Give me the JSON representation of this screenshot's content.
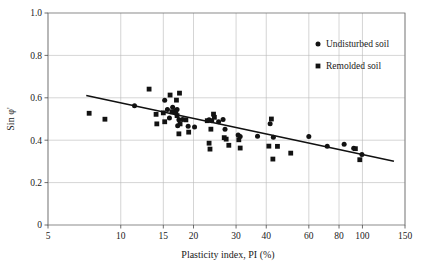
{
  "chart_data": {
    "type": "scatter",
    "title": "",
    "xlabel": "Plasticity index, PI (%)",
    "ylabel": "Sin φ'",
    "xscale": "log",
    "yscale": "linear",
    "xlim": [
      5,
      150
    ],
    "ylim": [
      0,
      1.0
    ],
    "grid": true,
    "xticks": [
      5,
      10,
      15,
      20,
      30,
      40,
      60,
      80,
      100,
      150
    ],
    "xtick_labels": [
      "5",
      "10",
      "15",
      "20",
      "30",
      "40",
      "60",
      "80",
      "100",
      "150"
    ],
    "yticks": [
      0,
      0.2,
      0.4,
      0.6,
      0.8,
      1.0
    ],
    "ytick_labels": [
      "0",
      "0.2",
      "0.4",
      "0.6",
      "0.8",
      "1.0"
    ],
    "legend_position": "top-right",
    "series": [
      {
        "name": "Undisturbed soil",
        "marker": "circle",
        "color": "#121212",
        "points": [
          [
            11.4,
            0.562
          ],
          [
            15.2,
            0.588
          ],
          [
            15.6,
            0.545
          ],
          [
            16.4,
            0.555
          ],
          [
            16.7,
            0.535
          ],
          [
            16.9,
            0.528
          ],
          [
            17.1,
            0.545
          ],
          [
            15.9,
            0.505
          ],
          [
            17.4,
            0.497
          ],
          [
            17.2,
            0.468
          ],
          [
            18.0,
            0.498
          ],
          [
            19.0,
            0.466
          ],
          [
            20.2,
            0.462
          ],
          [
            23.2,
            0.497
          ],
          [
            23.8,
            0.492
          ],
          [
            25.4,
            0.487
          ],
          [
            26.5,
            0.498
          ],
          [
            27.0,
            0.452
          ],
          [
            30.6,
            0.425
          ],
          [
            31.2,
            0.418
          ],
          [
            36.8,
            0.419
          ],
          [
            41.5,
            0.478
          ],
          [
            42.8,
            0.414
          ],
          [
            60.0,
            0.418
          ],
          [
            71.5,
            0.372
          ],
          [
            84.0,
            0.381
          ],
          [
            92.0,
            0.362
          ],
          [
            99.5,
            0.332
          ]
        ]
      },
      {
        "name": "Remolded soil",
        "marker": "square",
        "color": "#121212",
        "points": [
          [
            7.4,
            0.527
          ],
          [
            8.6,
            0.499
          ],
          [
            13.1,
            0.641
          ],
          [
            14.0,
            0.522
          ],
          [
            14.1,
            0.477
          ],
          [
            15.0,
            0.529
          ],
          [
            15.2,
            0.487
          ],
          [
            16.0,
            0.613
          ],
          [
            16.3,
            0.534
          ],
          [
            17.0,
            0.589
          ],
          [
            17.5,
            0.622
          ],
          [
            17.1,
            0.516
          ],
          [
            17.6,
            0.477
          ],
          [
            17.4,
            0.43
          ],
          [
            18.6,
            0.496
          ],
          [
            19.1,
            0.438
          ],
          [
            22.8,
            0.492
          ],
          [
            23.6,
            0.452
          ],
          [
            24.2,
            0.523
          ],
          [
            24.4,
            0.508
          ],
          [
            23.2,
            0.386
          ],
          [
            23.4,
            0.358
          ],
          [
            26.8,
            0.412
          ],
          [
            27.3,
            0.405
          ],
          [
            28.0,
            0.376
          ],
          [
            30.8,
            0.402
          ],
          [
            31.2,
            0.363
          ],
          [
            41.0,
            0.372
          ],
          [
            42.0,
            0.5
          ],
          [
            42.6,
            0.311
          ],
          [
            44.5,
            0.371
          ],
          [
            50.5,
            0.339
          ],
          [
            93.5,
            0.36
          ],
          [
            97.5,
            0.308
          ]
        ]
      }
    ],
    "trendline": {
      "name": "best-fit-line",
      "points": [
        [
          7.2,
          0.611
        ],
        [
          135.0,
          0.301
        ]
      ],
      "color": "#111111"
    }
  },
  "legend": {
    "items": [
      {
        "label": "Undisturbed soil",
        "marker": "circle"
      },
      {
        "label": "Remolded soil",
        "marker": "square"
      }
    ]
  }
}
